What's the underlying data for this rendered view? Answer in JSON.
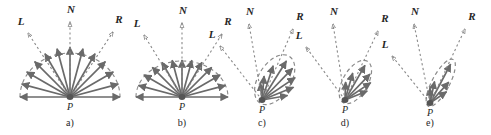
{
  "figure": {
    "width": 491,
    "height": 135,
    "background_color": "#ffffff",
    "arrow_color": "#6a6a6a",
    "dashed_color": "#8a8a8a",
    "label_color": "#262626",
    "point_color": "#555555"
  },
  "labels": {
    "normal": "N",
    "light": "L",
    "reflection": "R",
    "point": "P"
  },
  "panels": [
    {
      "caption": "a)",
      "kind": "ideal-diffuse",
      "origin": {
        "x": 70,
        "y": 97
      },
      "caption_pos": {
        "x": 70,
        "y": 126
      },
      "lobe": {
        "type": "semicircle",
        "radius_x": 50,
        "radius_y": 44,
        "axis_deg": 90
      },
      "point_label_pos": {
        "x": 70,
        "y": 110
      },
      "N": {
        "label_pos": {
          "x": 71,
          "y": 13
        },
        "tip": {
          "x": 70,
          "y": 22
        },
        "dash": true
      },
      "L": {
        "label_pos": {
          "x": 21,
          "y": 25
        },
        "tip": {
          "x": 28,
          "y": 33
        },
        "dash": true
      },
      "R": {
        "label_pos": {
          "x": 119,
          "y": 23
        },
        "tip": {
          "x": 113,
          "y": 32
        },
        "dash": true
      },
      "rays": [
        {
          "angle_deg": 0,
          "length": 50
        },
        {
          "angle_deg": 15,
          "length": 50
        },
        {
          "angle_deg": 30,
          "length": 50
        },
        {
          "angle_deg": 45,
          "length": 50
        },
        {
          "angle_deg": 60,
          "length": 50
        },
        {
          "angle_deg": 75,
          "length": 50
        },
        {
          "angle_deg": 90,
          "length": 50
        },
        {
          "angle_deg": 105,
          "length": 50
        },
        {
          "angle_deg": 120,
          "length": 50
        },
        {
          "angle_deg": 135,
          "length": 50
        },
        {
          "angle_deg": 150,
          "length": 50
        },
        {
          "angle_deg": 165,
          "length": 50
        },
        {
          "angle_deg": 180,
          "length": 50
        }
      ]
    },
    {
      "caption": "b)",
      "kind": "near-diffuse",
      "origin": {
        "x": 182,
        "y": 97
      },
      "caption_pos": {
        "x": 182,
        "y": 126
      },
      "lobe": {
        "type": "semicircle",
        "radius_x": 46,
        "radius_y": 36,
        "axis_deg": 90
      },
      "point_label_pos": {
        "x": 182,
        "y": 110
      },
      "N": {
        "label_pos": {
          "x": 183,
          "y": 14
        },
        "tip": {
          "x": 182,
          "y": 23
        },
        "dash": true
      },
      "L": {
        "label_pos": {
          "x": 137,
          "y": 27
        },
        "tip": {
          "x": 144,
          "y": 35
        },
        "dash": true
      },
      "R": {
        "label_pos": {
          "x": 228,
          "y": 25
        },
        "tip": {
          "x": 222,
          "y": 34
        },
        "dash": true
      },
      "rays": [
        {
          "angle_deg": 0,
          "length": 46
        },
        {
          "angle_deg": 15,
          "length": 45
        },
        {
          "angle_deg": 30,
          "length": 44
        },
        {
          "angle_deg": 45,
          "length": 42
        },
        {
          "angle_deg": 60,
          "length": 40
        },
        {
          "angle_deg": 75,
          "length": 38
        },
        {
          "angle_deg": 90,
          "length": 37
        },
        {
          "angle_deg": 105,
          "length": 38
        },
        {
          "angle_deg": 120,
          "length": 40
        },
        {
          "angle_deg": 135,
          "length": 42
        },
        {
          "angle_deg": 150,
          "length": 44
        },
        {
          "angle_deg": 165,
          "length": 45
        },
        {
          "angle_deg": 180,
          "length": 46
        }
      ]
    },
    {
      "caption": "c)",
      "kind": "glossy-broad",
      "origin": {
        "x": 262,
        "y": 100
      },
      "caption_pos": {
        "x": 262,
        "y": 126
      },
      "lobe": {
        "type": "lobe",
        "length": 46,
        "width": 26,
        "axis_deg": 58
      },
      "point_label_pos": {
        "x": 262,
        "y": 113
      },
      "N": {
        "label_pos": {
          "x": 250,
          "y": 15
        },
        "tip": {
          "x": 249,
          "y": 24
        },
        "dash": true
      },
      "L": {
        "label_pos": {
          "x": 212,
          "y": 38
        },
        "tip": {
          "x": 220,
          "y": 46
        },
        "dash": true
      },
      "R": {
        "label_pos": {
          "x": 300,
          "y": 20
        },
        "tip": {
          "x": 293,
          "y": 29
        },
        "dash": true
      },
      "rays": [
        {
          "angle_deg": 10,
          "length": 26
        },
        {
          "angle_deg": 22,
          "length": 34
        },
        {
          "angle_deg": 34,
          "length": 40
        },
        {
          "angle_deg": 46,
          "length": 44
        },
        {
          "angle_deg": 58,
          "length": 46
        },
        {
          "angle_deg": 72,
          "length": 36
        },
        {
          "angle_deg": 85,
          "length": 24
        },
        {
          "angle_deg": 96,
          "length": 17
        }
      ]
    },
    {
      "caption": "d)",
      "kind": "glossy-narrow",
      "origin": {
        "x": 345,
        "y": 100
      },
      "caption_pos": {
        "x": 345,
        "y": 126
      },
      "lobe": {
        "type": "lobe",
        "length": 40,
        "width": 20,
        "axis_deg": 60
      },
      "point_label_pos": {
        "x": 345,
        "y": 113
      },
      "N": {
        "label_pos": {
          "x": 334,
          "y": 15
        },
        "tip": {
          "x": 333,
          "y": 24
        },
        "dash": true
      },
      "L": {
        "label_pos": {
          "x": 299,
          "y": 39
        },
        "tip": {
          "x": 306,
          "y": 47
        },
        "dash": true
      },
      "R": {
        "label_pos": {
          "x": 385,
          "y": 22
        },
        "tip": {
          "x": 378,
          "y": 31
        },
        "dash": true
      },
      "rays": [
        {
          "angle_deg": 22,
          "length": 24
        },
        {
          "angle_deg": 34,
          "length": 31
        },
        {
          "angle_deg": 46,
          "length": 36
        },
        {
          "angle_deg": 60,
          "length": 40
        },
        {
          "angle_deg": 74,
          "length": 28
        },
        {
          "angle_deg": 88,
          "length": 18
        }
      ]
    },
    {
      "caption": "e)",
      "kind": "near-specular",
      "origin": {
        "x": 430,
        "y": 103
      },
      "caption_pos": {
        "x": 430,
        "y": 126
      },
      "lobe": {
        "type": "lobe",
        "length": 44,
        "width": 14,
        "axis_deg": 62
      },
      "point_label_pos": {
        "x": 430,
        "y": 116
      },
      "N": {
        "label_pos": {
          "x": 415,
          "y": 15
        },
        "tip": {
          "x": 414,
          "y": 24
        },
        "dash": true
      },
      "L": {
        "label_pos": {
          "x": 385,
          "y": 48
        },
        "tip": {
          "x": 392,
          "y": 56
        },
        "dash": true
      },
      "R": {
        "label_pos": {
          "x": 472,
          "y": 20
        },
        "tip": {
          "x": 465,
          "y": 29
        },
        "dash": true
      },
      "rays": [
        {
          "angle_deg": 34,
          "length": 20
        },
        {
          "angle_deg": 48,
          "length": 28
        },
        {
          "angle_deg": 62,
          "length": 44
        },
        {
          "angle_deg": 78,
          "length": 22
        },
        {
          "angle_deg": 90,
          "length": 15
        }
      ]
    }
  ]
}
